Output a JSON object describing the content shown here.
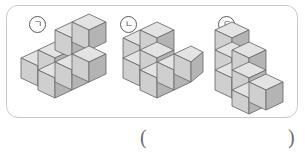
{
  "panel": {
    "border_color": "#c9c9c9"
  },
  "figures": [
    {
      "label": "ㄱ",
      "name": "figure-a",
      "description": "2x2 bottom layer with two cubes stacked on the back row",
      "cube_count": 6,
      "cubes": [
        {
          "x": 0,
          "y": 0,
          "z": 0
        },
        {
          "x": 1,
          "y": 0,
          "z": 0
        },
        {
          "x": 0,
          "y": 1,
          "z": 0
        },
        {
          "x": 1,
          "y": 1,
          "z": 0
        },
        {
          "x": 0,
          "y": 1,
          "z": 1
        },
        {
          "x": 1,
          "y": 1,
          "z": 1
        }
      ]
    },
    {
      "label": "ㄴ",
      "name": "figure-b",
      "description": "L-shaped arrangement, two cubes stacked at back-left with cubes to the front-right",
      "cube_count": 6,
      "cubes": [
        {
          "x": 0,
          "y": 0,
          "z": 0
        },
        {
          "x": 1,
          "y": 0,
          "z": 0
        },
        {
          "x": 0,
          "y": 1,
          "z": 0
        },
        {
          "x": 1,
          "y": 1,
          "z": 0
        },
        {
          "x": 0,
          "y": 1,
          "z": 1
        },
        {
          "x": 1,
          "y": 1,
          "z": 1
        }
      ]
    },
    {
      "label": "ㄷ",
      "name": "figure-c",
      "description": "Descending staircase: three-tall column at back, two-tall in middle, one-tall at front",
      "cube_count": 6,
      "cubes": [
        {
          "x": 0,
          "y": 0,
          "z": 0
        },
        {
          "x": 0,
          "y": 0,
          "z": 1
        },
        {
          "x": 0,
          "y": 0,
          "z": 2
        },
        {
          "x": 0,
          "y": 1,
          "z": 0
        },
        {
          "x": 0,
          "y": 1,
          "z": 1
        },
        {
          "x": 0,
          "y": 2,
          "z": 0
        }
      ]
    }
  ],
  "answer": {
    "open_paren": "(",
    "close_paren": ")",
    "value": ""
  },
  "colors": {
    "cube_top": "#e3e3e3",
    "cube_left": "#cfcfcf",
    "cube_right": "#b4b4b4",
    "cube_edge": "#6f6f6f",
    "label_text": "#4a4a4a",
    "paren": "#6b6b6b"
  }
}
